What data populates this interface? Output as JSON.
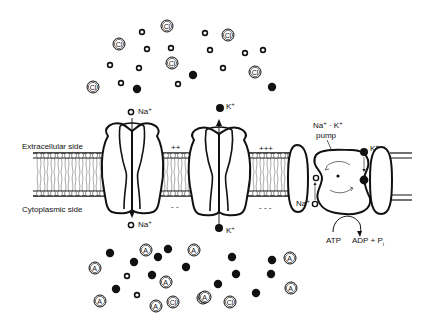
{
  "diagram": {
    "side_labels": {
      "extracellular": "Extracellular side",
      "cytoplasmic": "Cytoplasmic side"
    },
    "charges": {
      "seg2_top": "++",
      "seg2_bottom": "- -",
      "seg3_top": "+++",
      "seg3_bottom": "- - -"
    },
    "channels": [
      {
        "name": "Na+ channel",
        "ion_top": "Na",
        "ion_bottom": "Na",
        "charge": "+",
        "direction": "inward"
      },
      {
        "name": "K+ channel",
        "ion_top": "K",
        "ion_bottom": "K",
        "charge": "+",
        "direction": "outward"
      }
    ],
    "pump": {
      "label_line1": "Na",
      "label_mid": " · K",
      "label_line2": "pump",
      "na_label": "Na",
      "k_label": "K",
      "atp": "ATP",
      "adp": "ADP + P",
      "adp_sub": "i"
    },
    "ion_symbols": {
      "chloride": "Cl",
      "anion": "A",
      "anion_charge": "-",
      "plus": "+"
    },
    "legend_ions": {
      "open_ring": "Na+",
      "filled_dot": "K+",
      "circled_Cl": "Cl-",
      "circled_A": "A-"
    },
    "extracellular_particles": {
      "cl": [
        [
          167,
          26
        ],
        [
          119,
          44
        ],
        [
          93,
          87
        ],
        [
          172,
          63
        ],
        [
          228,
          35
        ],
        [
          255,
          72
        ]
      ],
      "na": [
        [
          142,
          32
        ],
        [
          147,
          49
        ],
        [
          171,
          48
        ],
        [
          110,
          65
        ],
        [
          139,
          68
        ],
        [
          121,
          83
        ],
        [
          178,
          84
        ],
        [
          205,
          33
        ],
        [
          210,
          50
        ],
        [
          245,
          53
        ],
        [
          263,
          50
        ],
        [
          223,
          68
        ]
      ],
      "k": [
        [
          137,
          89
        ],
        [
          193,
          75
        ],
        [
          272,
          87
        ]
      ]
    },
    "cytoplasmic_particles": {
      "k": [
        [
          110,
          253
        ],
        [
          134,
          262
        ],
        [
          158,
          257
        ],
        [
          168,
          249
        ],
        [
          152,
          275
        ],
        [
          186,
          267
        ],
        [
          116,
          289
        ],
        [
          232,
          257
        ],
        [
          236,
          274
        ],
        [
          218,
          284
        ],
        [
          272,
          260
        ],
        [
          271,
          274
        ],
        [
          256,
          293
        ]
      ],
      "a": [
        [
          95,
          268
        ],
        [
          146,
          250
        ],
        [
          194,
          250
        ],
        [
          166,
          282
        ],
        [
          100,
          301
        ],
        [
          156,
          306
        ],
        [
          203,
          298
        ],
        [
          290,
          258
        ],
        [
          291,
          288
        ],
        [
          205,
          297
        ]
      ],
      "cl": [
        [
          173,
          302
        ],
        [
          230,
          302
        ]
      ],
      "na": [
        [
          127,
          276
        ],
        [
          137,
          295
        ]
      ]
    }
  }
}
